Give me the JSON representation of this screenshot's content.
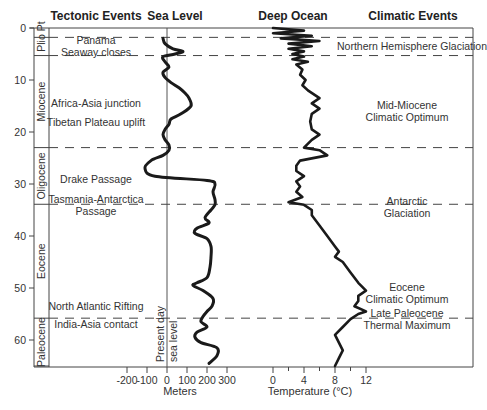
{
  "chart_data": {
    "type": "line",
    "title": "",
    "column_headers": [
      "Tectonic Events",
      "Sea Level",
      "Deep Ocean",
      "Climatic Events"
    ],
    "y_axis": {
      "label": "Age (Ma)",
      "ticks": [
        0,
        10,
        20,
        30,
        40,
        50,
        60
      ],
      "range": [
        0,
        65
      ],
      "inverted": true
    },
    "epochs": [
      {
        "name": "Plio/Pl",
        "top": 0,
        "bottom": 5.3,
        "label_lines": [
          "Plio",
          "Pt"
        ]
      },
      {
        "name": "Miocene",
        "top": 5.3,
        "bottom": 23
      },
      {
        "name": "Oligocene",
        "top": 23,
        "bottom": 33.9
      },
      {
        "name": "Eocene",
        "top": 33.9,
        "bottom": 55.8
      },
      {
        "name": "Paleocene",
        "top": 55.8,
        "bottom": 65
      }
    ],
    "boundaries_dashed": [
      1.8,
      5.3,
      23,
      33.9,
      55.8
    ],
    "sea_level": {
      "xlabel": "Meters",
      "xticks": [
        -200,
        -100,
        0,
        100,
        200,
        300
      ],
      "reference_label": [
        "Present day",
        "sea level"
      ],
      "series": [
        [
          2,
          -20
        ],
        [
          3,
          -10
        ],
        [
          4,
          30
        ],
        [
          4.5,
          80
        ],
        [
          5,
          40
        ],
        [
          5.5,
          -20
        ],
        [
          6.5,
          -10
        ],
        [
          7.5,
          10
        ],
        [
          8.5,
          -20
        ],
        [
          9.5,
          -10
        ],
        [
          10.5,
          20
        ],
        [
          11.5,
          60
        ],
        [
          12.5,
          90
        ],
        [
          13.5,
          110
        ],
        [
          15,
          120
        ],
        [
          16.5,
          70
        ],
        [
          17.5,
          20
        ],
        [
          18.5,
          10
        ],
        [
          19.5,
          -10
        ],
        [
          20.5,
          -20
        ],
        [
          21.5,
          -10
        ],
        [
          22.5,
          10
        ],
        [
          23.5,
          10
        ],
        [
          24.5,
          -20
        ],
        [
          25.5,
          -80
        ],
        [
          27,
          -110
        ],
        [
          28.5,
          -60
        ],
        [
          29.3,
          200
        ],
        [
          30,
          240
        ],
        [
          31.5,
          230
        ],
        [
          33,
          240
        ],
        [
          34,
          240
        ],
        [
          35,
          220
        ],
        [
          36.5,
          190
        ],
        [
          37.5,
          210
        ],
        [
          38.5,
          150
        ],
        [
          39.5,
          140
        ],
        [
          40.5,
          200
        ],
        [
          42,
          220
        ],
        [
          44,
          220
        ],
        [
          46,
          215
        ],
        [
          48,
          200
        ],
        [
          49,
          150
        ],
        [
          49.5,
          130
        ],
        [
          50.5,
          180
        ],
        [
          52,
          230
        ],
        [
          53.5,
          225
        ],
        [
          54.5,
          200
        ],
        [
          55.5,
          180
        ],
        [
          56.5,
          170
        ],
        [
          57.5,
          200
        ],
        [
          58.5,
          150
        ],
        [
          59.5,
          140
        ],
        [
          60.5,
          170
        ],
        [
          61.5,
          250
        ],
        [
          63,
          250
        ],
        [
          64.5,
          210
        ]
      ]
    },
    "deep_ocean": {
      "xlabel": "Temperature (°C)",
      "xticks": [
        0,
        4,
        8,
        12
      ],
      "minor_ticks": [
        2,
        6,
        10
      ],
      "series": [
        [
          0,
          0
        ],
        [
          0.5,
          4
        ],
        [
          1,
          0
        ],
        [
          1.5,
          5
        ],
        [
          2,
          1
        ],
        [
          2.5,
          6
        ],
        [
          3,
          2
        ],
        [
          3.5,
          5
        ],
        [
          4,
          2
        ],
        [
          4.5,
          4
        ],
        [
          5,
          2.5
        ],
        [
          5.5,
          4
        ],
        [
          6,
          2.5
        ],
        [
          6.5,
          4.5
        ],
        [
          7,
          3
        ],
        [
          8,
          3.8
        ],
        [
          9,
          3.5
        ],
        [
          10,
          4.2
        ],
        [
          11,
          3.8
        ],
        [
          12,
          4.5
        ],
        [
          13.5,
          6
        ],
        [
          14.5,
          5
        ],
        [
          15.5,
          6
        ],
        [
          16.5,
          5
        ],
        [
          18,
          4.8
        ],
        [
          19.5,
          5
        ],
        [
          20.5,
          6
        ],
        [
          21.5,
          5
        ],
        [
          23,
          4
        ],
        [
          23.5,
          6
        ],
        [
          24.5,
          7
        ],
        [
          25.5,
          3.5
        ],
        [
          26.5,
          3
        ],
        [
          27.5,
          3
        ],
        [
          28.5,
          4
        ],
        [
          29.5,
          3
        ],
        [
          30.5,
          3.5
        ],
        [
          31.5,
          3
        ],
        [
          32.5,
          3.8
        ],
        [
          33.5,
          2
        ],
        [
          34,
          4
        ],
        [
          35,
          5
        ],
        [
          36,
          5
        ],
        [
          38,
          6
        ],
        [
          40,
          7
        ],
        [
          42,
          8
        ],
        [
          43,
          8.5
        ],
        [
          44,
          8
        ],
        [
          45,
          9
        ],
        [
          47,
          10
        ],
        [
          49,
          11
        ],
        [
          50.5,
          12
        ],
        [
          51.5,
          11
        ],
        [
          52.5,
          11
        ],
        [
          53.5,
          10.5
        ],
        [
          54.5,
          12
        ],
        [
          55,
          11
        ],
        [
          56,
          10
        ],
        [
          57.5,
          9
        ],
        [
          59,
          8
        ],
        [
          60.5,
          8.5
        ],
        [
          62,
          9
        ],
        [
          63.5,
          8.5
        ],
        [
          65,
          8
        ]
      ]
    },
    "annotations": {
      "tectonic": [
        {
          "text": [
            "Panama",
            "Seaway closes"
          ],
          "age": 3.5
        },
        {
          "text": [
            "Africa-Asia junction"
          ],
          "age": 14.5
        },
        {
          "text": [
            "Tibetan Plateau uplift"
          ],
          "age": 18
        },
        {
          "text": [
            "Drake Passage"
          ],
          "age": 29
        },
        {
          "text": [
            "Tasmania-Antarctica",
            "Passage"
          ],
          "age": 34
        },
        {
          "text": [
            "North Atlantic Rifting"
          ],
          "age": 53.5
        },
        {
          "text": [
            "India-Asia contact"
          ],
          "age": 57
        }
      ],
      "climatic": [
        {
          "text": [
            "Northern Hemisphere Glaciation"
          ],
          "age": 3.5
        },
        {
          "text": [
            "Mid-Miocene",
            "Climatic Optimum"
          ],
          "age": 16
        },
        {
          "text": [
            "Antarctic",
            "Glaciation"
          ],
          "age": 34.5
        },
        {
          "text": [
            "Eocene",
            "Climatic Optimum"
          ],
          "age": 51
        },
        {
          "text": [
            "Late Paleocene",
            "Thermal Maximum"
          ],
          "age": 56
        }
      ]
    }
  },
  "labels": {
    "h_tectonic": "Tectonic Events",
    "h_sea": "Sea Level",
    "h_deep": "Deep Ocean",
    "h_climatic": "Climatic Events",
    "meters": "Meters",
    "temperature": "Temperature (°C)",
    "present1": "Present day",
    "present2": "sea level"
  }
}
